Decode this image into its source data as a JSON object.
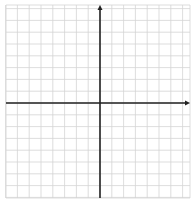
{
  "diagram": {
    "type": "coordinate-plane",
    "width": 191,
    "height": 202,
    "grid": {
      "left": 6,
      "top": 5,
      "right": 190,
      "bottom": 198,
      "spacing": 11.8,
      "color": "#d4d4d4"
    },
    "axes": {
      "origin_x": 100,
      "origin_y": 103,
      "color": "#222222",
      "x_axis_arrow": "right",
      "y_axis_arrow": "up"
    }
  }
}
